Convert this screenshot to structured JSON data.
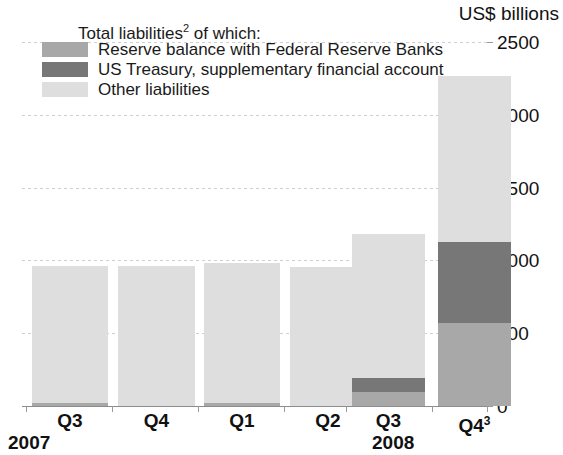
{
  "axis": {
    "unit_label": "US$ billions",
    "y_ticks": [
      "2500",
      "2000",
      "1500",
      "1000",
      "500",
      "0"
    ]
  },
  "legend": {
    "title": "Total liabilities",
    "title_sup": "2",
    "title_suffix": " of which:",
    "items": [
      {
        "label": "Reserve balance with Federal Reserve Banks",
        "color": "#a8a8a8",
        "key": "reserve"
      },
      {
        "label": "US Treasury, supplementary financial account",
        "color": "#777777",
        "key": "treasury"
      },
      {
        "label": "Other liabilities",
        "color": "#dedede",
        "key": "other"
      }
    ]
  },
  "categories": [
    {
      "label": "Q3",
      "sup": "",
      "year": "2007"
    },
    {
      "label": "Q4",
      "sup": "",
      "year": "2007"
    },
    {
      "label": "Q1",
      "sup": "",
      "year": "2008"
    },
    {
      "label": "Q2",
      "sup": "",
      "year": "2008"
    },
    {
      "label": "Q3",
      "sup": "",
      "year": "2008"
    },
    {
      "label": "Q4",
      "sup": "3",
      "year": "2008"
    }
  ],
  "year_groups": [
    {
      "label": "2007"
    },
    {
      "label": "2008"
    }
  ],
  "chart_data": {
    "type": "bar",
    "stacked": true,
    "title": "",
    "subtitle": "",
    "xlabel": "",
    "ylabel": "US$ billions",
    "ylim": [
      0,
      2500
    ],
    "yticks": [
      0,
      500,
      1000,
      1500,
      2000,
      2500
    ],
    "grid": true,
    "legend_position": "top-left",
    "categories": [
      "Q3 2007",
      "Q4 2007",
      "Q1 2008",
      "Q2 2008",
      "Q3 2008",
      "Q4 2008"
    ],
    "series": [
      {
        "name": "Reserve balance with Federal Reserve Banks",
        "color": "#a8a8a8",
        "values": [
          20,
          0,
          20,
          0,
          100,
          570
        ]
      },
      {
        "name": "US Treasury, supplementary financial account",
        "color": "#777777",
        "values": [
          0,
          0,
          0,
          0,
          100,
          560
        ]
      },
      {
        "name": "Other liabilities",
        "color": "#dedede",
        "values": [
          910,
          935,
          960,
          950,
          980,
          1130
        ]
      }
    ],
    "totals": [
      930,
      935,
      980,
      950,
      1180,
      2260
    ],
    "footnote_markers": [
      "2",
      "3"
    ]
  },
  "render": {
    "y_zero_px": 406,
    "y_top_px": 42,
    "px_per_unit": 0.1456,
    "bars": [
      {
        "x": 32,
        "w": 76,
        "segments": [
          {
            "key": "other",
            "top": 266,
            "height": 137
          },
          {
            "key": "reserve",
            "top": 403,
            "height": 3
          }
        ]
      },
      {
        "x": 118,
        "w": 77,
        "segments": [
          {
            "key": "other",
            "top": 266,
            "height": 140
          }
        ]
      },
      {
        "x": 204,
        "w": 76,
        "segments": [
          {
            "key": "other",
            "top": 263,
            "height": 140
          },
          {
            "key": "reserve",
            "top": 403,
            "height": 3
          }
        ]
      },
      {
        "x": 290,
        "w": 76,
        "segments": [
          {
            "key": "other",
            "top": 267,
            "height": 139
          }
        ]
      },
      {
        "x": 352,
        "w": 73,
        "segments": [
          {
            "key": "other",
            "top": 234,
            "height": 144
          },
          {
            "key": "treasury",
            "top": 378,
            "height": 14
          },
          {
            "key": "reserve",
            "top": 392,
            "height": 14
          }
        ]
      },
      {
        "x": 438,
        "w": 73,
        "segments": [
          {
            "key": "other",
            "top": 76,
            "height": 166
          },
          {
            "key": "treasury",
            "top": 242,
            "height": 81
          },
          {
            "key": "reserve",
            "top": 323,
            "height": 83
          }
        ]
      }
    ],
    "bar_left_overrides": [
      32,
      118,
      204,
      290,
      352,
      438
    ],
    "gridline_y": [
      42,
      115,
      188,
      260,
      333
    ],
    "xtick_x": [
      26,
      112,
      198,
      284,
      346,
      432,
      487
    ],
    "year_x": [
      8,
      380
    ]
  }
}
